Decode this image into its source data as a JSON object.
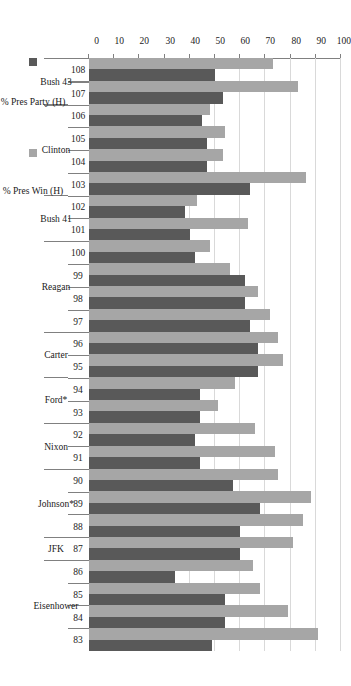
{
  "chart_data": {
    "type": "bar",
    "orientation": "horizontal-rotated",
    "title": "",
    "xlabel": "",
    "ylabel": "",
    "ylim": [
      0,
      100
    ],
    "ytick_step": 10,
    "yticks": [
      0,
      10,
      20,
      30,
      40,
      50,
      60,
      70,
      80,
      90,
      100
    ],
    "grid": true,
    "legend_position": "bottom",
    "categories": [
      "83",
      "84",
      "85",
      "86",
      "87",
      "88",
      "89",
      "90",
      "91",
      "92",
      "93",
      "94",
      "95",
      "96",
      "97",
      "98",
      "99",
      "100",
      "101",
      "102",
      "103",
      "104",
      "105",
      "106",
      "107",
      "108"
    ],
    "group_labels": [
      {
        "label": "Eisenhower",
        "categories": [
          "83",
          "84",
          "85",
          "86"
        ]
      },
      {
        "label": "JFK",
        "categories": [
          "87"
        ]
      },
      {
        "label": "Johnson*",
        "categories": [
          "88",
          "89",
          "90"
        ]
      },
      {
        "label": "Nixon",
        "categories": [
          "91",
          "92"
        ]
      },
      {
        "label": "Ford*",
        "categories": [
          "93",
          "94"
        ]
      },
      {
        "label": "Carter",
        "categories": [
          "95",
          "96"
        ]
      },
      {
        "label": "Reagan",
        "categories": [
          "97",
          "98",
          "99",
          "100"
        ]
      },
      {
        "label": "Bush 41",
        "categories": [
          "101",
          "102"
        ]
      },
      {
        "label": "Clinton",
        "categories": [
          "103",
          "104",
          "105",
          "106"
        ]
      },
      {
        "label": "Bush 43",
        "categories": [
          "107",
          "108"
        ]
      }
    ],
    "series": [
      {
        "name": "% Pres Win (H)",
        "color": "#a6a6a6",
        "values": [
          91,
          79,
          68,
          65,
          81,
          85,
          88,
          75,
          74,
          66,
          51,
          58,
          77,
          75,
          72,
          67,
          56,
          48,
          63,
          43,
          86,
          53,
          54,
          48,
          83,
          73
        ]
      },
      {
        "name": "% Pres Party (H)",
        "color": "#595959",
        "values": [
          49,
          54,
          54,
          34,
          60,
          60,
          68,
          57,
          44,
          42,
          44,
          44,
          67,
          67,
          64,
          62,
          62,
          42,
          40,
          38,
          64,
          47,
          47,
          45,
          53,
          50
        ]
      }
    ],
    "legend": [
      {
        "label": "% Pres Win (H)",
        "color": "#a6a6a6"
      },
      {
        "label": "% Pres Party (H)",
        "color": "#595959"
      }
    ]
  }
}
